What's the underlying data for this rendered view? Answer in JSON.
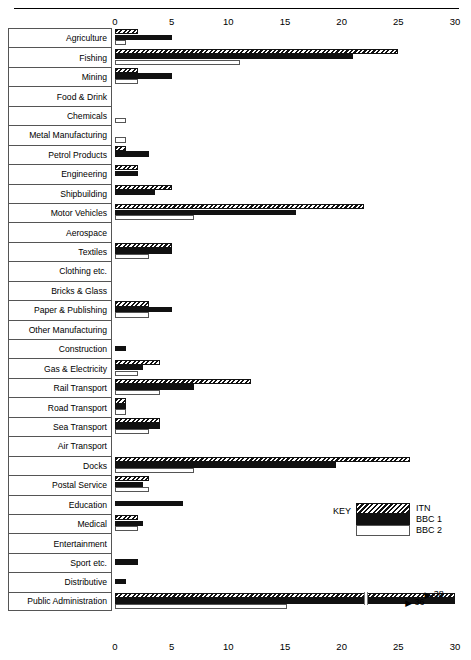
{
  "chart_data": {
    "type": "bar",
    "orientation": "horizontal",
    "title": "",
    "xlabel": "",
    "ylabel": "",
    "xlim": [
      0,
      30
    ],
    "xticks": [
      0,
      5,
      10,
      15,
      20,
      25,
      30
    ],
    "grid": false,
    "axis_top": true,
    "axis_bottom": true,
    "legend": {
      "key_label": "KEY",
      "position": "inside-right",
      "entries": [
        {
          "name": "ITN",
          "pattern": "diagonal-hatch"
        },
        {
          "name": "BBC 1",
          "pattern": "solid-black"
        },
        {
          "name": "BBC 2",
          "pattern": "white-outline"
        }
      ]
    },
    "categories": [
      "Agriculture",
      "Fishing",
      "Mining",
      "Food & Drink",
      "Chemicals",
      "Metal Manufacturing",
      "Petrol Products",
      "Engineering",
      "Shipbuilding",
      "Motor Vehicles",
      "Aerospace",
      "Textiles",
      "Clothing etc.",
      "Bricks & Glass",
      "Paper & Publishing",
      "Other Manufacturing",
      "Construction",
      "Gas & Electricity",
      "Rail Transport",
      "Road Transport",
      "Sea Transport",
      "Air Transport",
      "Docks",
      "Postal Service",
      "Education",
      "Medical",
      "Entertainment",
      "Sport etc.",
      "Distributive",
      "Public Administration"
    ],
    "series": [
      {
        "name": "ITN",
        "values": [
          2,
          25,
          2,
          0,
          0,
          0,
          1,
          2,
          5,
          22,
          0,
          5,
          0,
          0,
          3,
          0,
          0,
          4,
          12,
          1,
          4,
          0,
          26,
          3,
          0,
          2,
          0,
          0,
          0,
          38
        ]
      },
      {
        "name": "BBC 1",
        "values": [
          5,
          21,
          5,
          0,
          0,
          0,
          3,
          2,
          3.5,
          16,
          0,
          5,
          0,
          0,
          5,
          0,
          1,
          2.5,
          7,
          1,
          4,
          0,
          19.5,
          2.5,
          6,
          2.5,
          0,
          2,
          1,
          36
        ]
      },
      {
        "name": "BBC 2",
        "values": [
          1,
          11,
          2,
          0,
          1,
          1,
          0,
          0,
          0,
          7,
          0,
          3,
          0,
          0,
          3,
          0,
          0,
          2,
          4,
          1,
          3,
          0,
          7,
          3,
          0,
          2,
          0,
          0,
          0,
          15.2
        ]
      }
    ],
    "annotations": [
      {
        "category": "Public Administration",
        "series": "ITN",
        "label": "38",
        "note": "bar broken, value exceeds axis"
      },
      {
        "category": "Public Administration",
        "series": "BBC 1",
        "label": "36",
        "note": "bar broken, value exceeds axis"
      }
    ]
  }
}
